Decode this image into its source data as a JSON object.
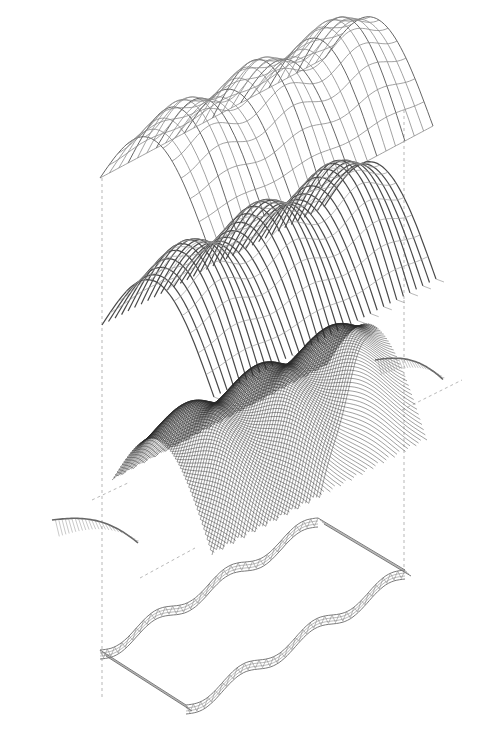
{
  "figure": {
    "type": "exploded-axonometric",
    "background": "#ffffff",
    "line_color": "#3a3a3a",
    "layers": [
      {
        "id": "top-grid-shell",
        "description": "orthogonal grid shell with undulating crest"
      },
      {
        "id": "rib-layer",
        "description": "arched timber ribs with purlins"
      },
      {
        "id": "diagrid-mesh",
        "description": "dense diagonal lattice skin"
      },
      {
        "id": "end-arch-left",
        "description": "hatched end arch, front"
      },
      {
        "id": "end-arch-right",
        "description": "hatched end arch, back"
      },
      {
        "id": "base-truss-ring",
        "description": "undulating perimeter truss foundation"
      }
    ],
    "projection_lines": "dashed"
  }
}
